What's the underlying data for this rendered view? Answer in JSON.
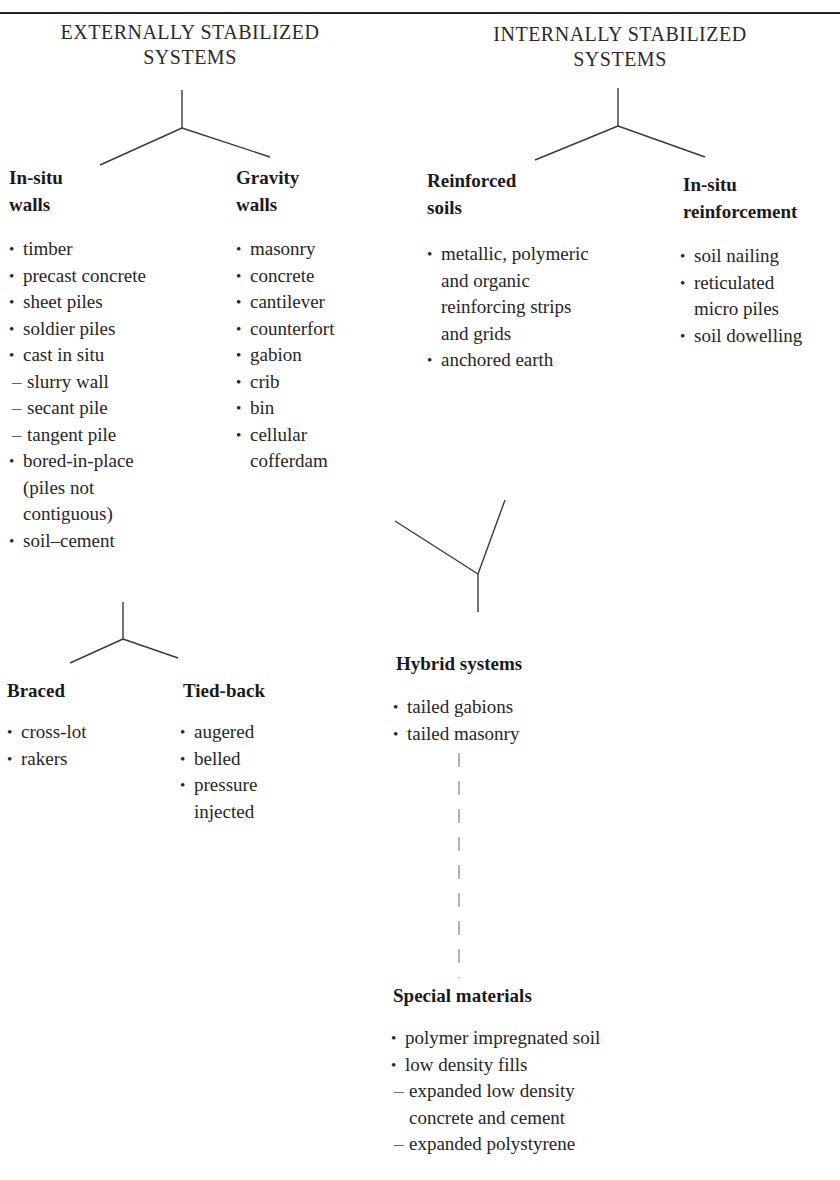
{
  "header": {
    "left_title_line1": "EXTERNALLY STABILIZED",
    "left_title_line2": "SYSTEMS",
    "right_title_line1": "INTERNALLY STABILIZED",
    "right_title_line2": "SYSTEMS"
  },
  "external": {
    "in_situ_walls": {
      "title_line1": "In-situ",
      "title_line2": "walls",
      "items": [
        {
          "type": "bullet",
          "text": "timber"
        },
        {
          "type": "bullet",
          "text": "precast concrete"
        },
        {
          "type": "bullet",
          "text": "sheet piles"
        },
        {
          "type": "bullet",
          "text": "soldier piles"
        },
        {
          "type": "bullet",
          "text": "cast in situ"
        },
        {
          "type": "sub",
          "text": "slurry wall"
        },
        {
          "type": "sub",
          "text": "secant pile"
        },
        {
          "type": "sub",
          "text": "tangent pile"
        },
        {
          "type": "bullet",
          "text": "bored-in-place"
        },
        {
          "type": "cont",
          "text": "(piles not"
        },
        {
          "type": "cont",
          "text": "contiguous)"
        },
        {
          "type": "bullet",
          "text": "soil–cement"
        }
      ]
    },
    "gravity_walls": {
      "title_line1": "Gravity",
      "title_line2": "walls",
      "items": [
        {
          "type": "bullet",
          "text": "masonry"
        },
        {
          "type": "bullet",
          "text": "concrete"
        },
        {
          "type": "bullet",
          "text": "cantilever"
        },
        {
          "type": "bullet",
          "text": "counterfort"
        },
        {
          "type": "bullet",
          "text": "gabion"
        },
        {
          "type": "bullet",
          "text": "crib"
        },
        {
          "type": "bullet",
          "text": "bin"
        },
        {
          "type": "bullet",
          "text": "cellular"
        },
        {
          "type": "cont",
          "text": "cofferdam"
        }
      ]
    },
    "braced": {
      "title": "Braced",
      "items": [
        {
          "type": "bullet",
          "text": "cross-lot"
        },
        {
          "type": "bullet",
          "text": "rakers"
        }
      ]
    },
    "tied_back": {
      "title": "Tied-back",
      "items": [
        {
          "type": "bullet",
          "text": "augered"
        },
        {
          "type": "bullet",
          "text": "belled"
        },
        {
          "type": "bullet",
          "text": "pressure"
        },
        {
          "type": "cont",
          "text": "injected"
        }
      ]
    }
  },
  "internal": {
    "reinforced_soils": {
      "title_line1": "Reinforced",
      "title_line2": "soils",
      "items": [
        {
          "type": "bullet",
          "text": "metallic, polymeric"
        },
        {
          "type": "cont",
          "text": "and organic"
        },
        {
          "type": "cont",
          "text": "reinforcing strips"
        },
        {
          "type": "cont",
          "text": "and grids"
        },
        {
          "type": "bullet",
          "text": "anchored earth"
        }
      ]
    },
    "in_situ_reinforcement": {
      "title_line1": "In-situ",
      "title_line2": "reinforcement",
      "items": [
        {
          "type": "bullet",
          "text": "soil nailing"
        },
        {
          "type": "bullet",
          "text": "reticulated"
        },
        {
          "type": "cont",
          "text": "micro piles"
        },
        {
          "type": "bullet",
          "text": "soil dowelling"
        }
      ]
    }
  },
  "hybrid_systems": {
    "title": "Hybrid systems",
    "items": [
      {
        "type": "bullet",
        "text": "tailed gabions"
      },
      {
        "type": "bullet",
        "text": "tailed masonry"
      }
    ]
  },
  "special_materials": {
    "title": "Special materials",
    "items": [
      {
        "type": "bullet",
        "text": "polymer impregnated soil"
      },
      {
        "type": "bullet",
        "text": "low density fills"
      },
      {
        "type": "sub",
        "text": "expanded low density"
      },
      {
        "type": "subcont",
        "text": "concrete and cement"
      },
      {
        "type": "sub",
        "text": "expanded polystyrene"
      }
    ]
  },
  "colors": {
    "text": "#1e1e1e",
    "lines": "#333333",
    "background": "#ffffff"
  }
}
